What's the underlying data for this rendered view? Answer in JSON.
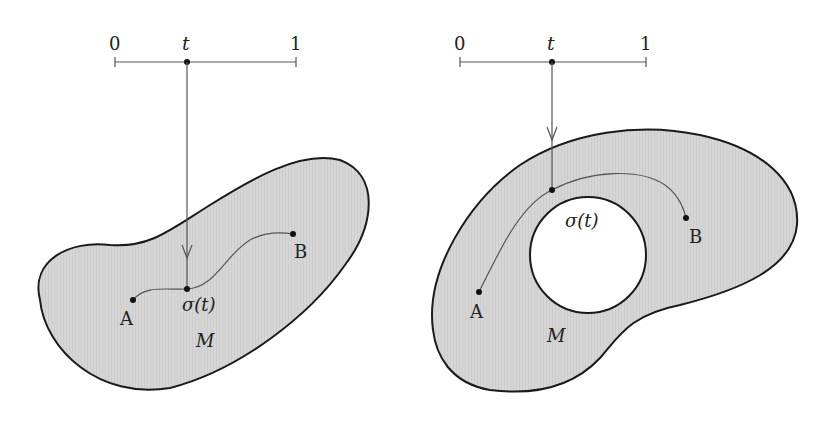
{
  "figure": {
    "colors": {
      "region_fill": "#d4d4d4",
      "stroke": "#1a1a1a",
      "curve": "#555555",
      "background": "#ffffff"
    },
    "left_panel": {
      "interval": {
        "start_label": "0",
        "param_label": "t",
        "end_label": "1"
      },
      "region_label": "M",
      "point_a_label": "A",
      "point_b_label": "B",
      "path_point_label": "σ(t)"
    },
    "right_panel": {
      "interval": {
        "start_label": "0",
        "param_label": "t",
        "end_label": "1"
      },
      "region_label": "M",
      "point_a_label": "A",
      "point_b_label": "B",
      "path_point_label": "σ(t)"
    }
  }
}
